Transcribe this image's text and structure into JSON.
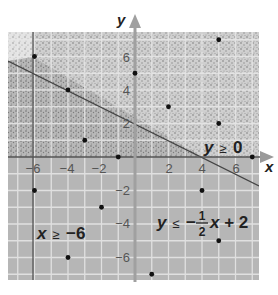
{
  "diagram": {
    "type": "inequality-graph",
    "axes": {
      "x_label": "x",
      "y_label": "y",
      "x_ticks": [
        {
          "value": -6,
          "label": "−6"
        },
        {
          "value": -4,
          "label": "−4"
        },
        {
          "value": -2,
          "label": "−2"
        },
        {
          "value": 2,
          "label": "2"
        },
        {
          "value": 4,
          "label": "4"
        },
        {
          "value": 6,
          "label": "6"
        }
      ],
      "y_ticks": [
        {
          "value": 6,
          "label": "6"
        },
        {
          "value": 4,
          "label": "4"
        },
        {
          "value": 2,
          "label": "2"
        },
        {
          "value": -2,
          "label": "−2"
        },
        {
          "value": -4,
          "label": "−4"
        },
        {
          "value": -6,
          "label": "−6"
        }
      ],
      "x_range": [
        -7.6,
        7.4
      ],
      "y_range": [
        -7.4,
        7.5
      ]
    },
    "inequalities": [
      {
        "id": "y_ge_0",
        "text": "y ≥ 0",
        "var": "y",
        "op": "≥",
        "rhs": "0"
      },
      {
        "id": "x_ge_neg6",
        "text": "x ≥ −6",
        "var": "x",
        "op": "≥",
        "rhs": "−6"
      },
      {
        "id": "y_le_line",
        "text": "y ≤ −1/2 x + 2",
        "var": "y",
        "op": "≤",
        "rhs_prefix": "−",
        "frac_num": "1",
        "frac_den": "2",
        "rhs_suffix": "x + 2"
      }
    ],
    "boundary_lines": [
      {
        "equation": "y = -0.5x + 2",
        "slope": -0.5,
        "intercept": 2
      },
      {
        "equation": "x = -6"
      },
      {
        "equation": "y = 0"
      }
    ],
    "points": [
      {
        "x": -6,
        "y": 6
      },
      {
        "x": -4,
        "y": 4
      },
      {
        "x": -3,
        "y": 1
      },
      {
        "x": -1,
        "y": 0
      },
      {
        "x": 0,
        "y": 5
      },
      {
        "x": 5,
        "y": 7
      },
      {
        "x": 2,
        "y": 3
      },
      {
        "x": 5,
        "y": 2
      },
      {
        "x": 7,
        "y": 0
      },
      {
        "x": -6,
        "y": -2
      },
      {
        "x": -2,
        "y": -3
      },
      {
        "x": -4,
        "y": -6
      },
      {
        "x": 4,
        "y": -2
      },
      {
        "x": 5,
        "y": -5
      },
      {
        "x": 1,
        "y": -7
      }
    ],
    "colors": {
      "grid_bg": "#b4b4b4",
      "grid_line": "#e6e6e6",
      "stipple_light": "#e2e2e2",
      "stipple_mid": "#c8c8c8",
      "axis": "#9a9a9a",
      "boundary": "#4a4a4a",
      "point": "#111111"
    }
  }
}
